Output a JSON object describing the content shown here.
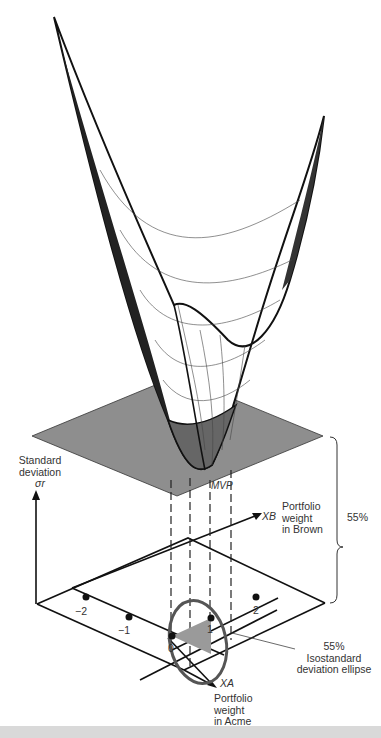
{
  "diagram": {
    "type": "3d-surface-portfolio-risk",
    "surface": {
      "description": "Standard deviation surface over portfolio weights",
      "color": "#111111"
    },
    "plane": {
      "label_percent": "55%",
      "color": "#8c8c8c"
    },
    "labels": {
      "y_axis_line1": "Standard",
      "y_axis_line2": "deviation",
      "y_axis_symbol": "σr",
      "xb_symbol": "XB",
      "xb_line1": "Portfolio",
      "xb_line2": "weight",
      "xb_line3": "in Brown",
      "xa_symbol": "XA",
      "xa_line1": "Portfolio",
      "xa_line2": "weight",
      "xa_line3": "in Acme",
      "mvp": "MVP",
      "brace_value": "55%",
      "ellipse_line1": "55%",
      "ellipse_line2": "Isostandard",
      "ellipse_line3": "deviation ellipse"
    },
    "ticks": {
      "t_neg2": "−2",
      "t_neg1": "−1",
      "t_0": "0",
      "t_1": "1",
      "t_2": "2"
    },
    "ellipse_color": "#555555",
    "triangle_fill": "#9a9a9a"
  }
}
